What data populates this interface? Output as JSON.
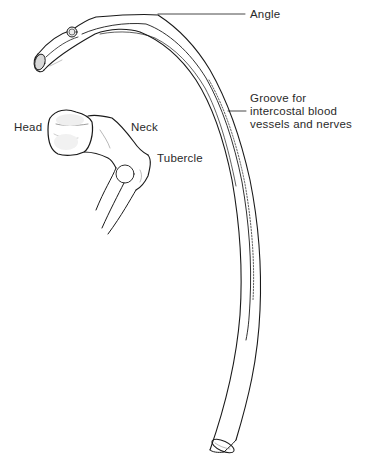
{
  "figure": {
    "colors": {
      "line": "#1a1a1a",
      "text": "#2a2a2a",
      "background": "#ffffff",
      "shading": "#bdbdbd"
    }
  },
  "labels": {
    "angle": "Angle",
    "groove": {
      "line1": "Groove for",
      "line2": "intercostal blood",
      "line3": "vessels and nerves"
    },
    "head": "Head",
    "neck": "Neck",
    "tubercle": "Tubercle"
  }
}
